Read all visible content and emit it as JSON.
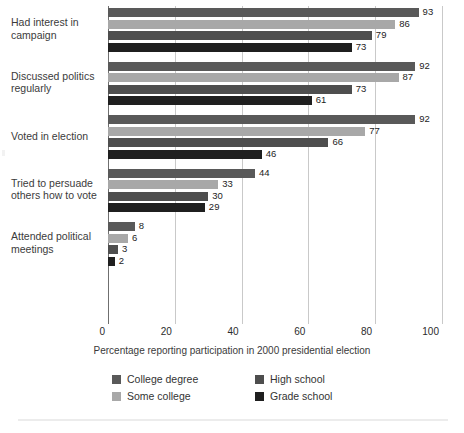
{
  "chart_data": {
    "type": "bar",
    "orientation": "horizontal",
    "title": "",
    "xlabel": "Percentage reporting participation in 2000 presidential election",
    "ylabel": "",
    "xlim": [
      0,
      100
    ],
    "xticks": [
      0,
      20,
      40,
      60,
      80,
      100
    ],
    "xticklabels": [
      "0",
      "20",
      "40",
      "60",
      "80",
      "100"
    ],
    "grid": true,
    "grid_axis": "x",
    "legend_position": "bottom",
    "categories": [
      "Had interest in campaign",
      "Discussed politics regularly",
      "Voted in election",
      "Tried to persuade others how to vote",
      "Attended political meetings"
    ],
    "category_label_lines": [
      [
        "Had interest in",
        "campaign"
      ],
      [
        "Discussed politics",
        "regularly"
      ],
      [
        "Voted in election"
      ],
      [
        "Tried to persuade",
        "others how to vote"
      ],
      [
        "Attended political",
        "meetings"
      ]
    ],
    "series": [
      {
        "name": "College degree",
        "color": "#595959",
        "values": [
          93,
          92,
          92,
          44,
          8
        ]
      },
      {
        "name": "Some college",
        "color": "#a8a8a8",
        "values": [
          86,
          87,
          77,
          33,
          6
        ]
      },
      {
        "name": "High school",
        "color": "#4e4e4e",
        "values": [
          79,
          73,
          66,
          30,
          3
        ]
      },
      {
        "name": "Grade school",
        "color": "#1f1f1f",
        "values": [
          73,
          61,
          46,
          29,
          2
        ]
      }
    ]
  },
  "legend": {
    "entries": [
      {
        "label": "College degree",
        "color": "#595959"
      },
      {
        "label": "High school",
        "color": "#4e4e4e"
      },
      {
        "label": "Some college",
        "color": "#a8a8a8"
      },
      {
        "label": "Grade school",
        "color": "#1f1f1f"
      }
    ]
  },
  "style": {
    "gridline_color": "#c9c9c9",
    "axis_color": "#6f6f6f",
    "value_label_color": "#1c1c1c",
    "category_label_color": "#3b3b3b",
    "background": "#ffffff"
  }
}
